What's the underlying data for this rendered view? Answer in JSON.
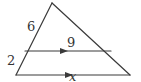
{
  "figure": {
    "type": "triangle-proportionality",
    "stroke_color": "#3a3a3a",
    "background": "#ffffff",
    "vertices": {
      "apex": [
        52,
        3
      ],
      "base_left": [
        16,
        75
      ],
      "base_right": [
        130,
        75
      ]
    },
    "parallel_segment": {
      "from": [
        25,
        51
      ],
      "to": [
        111,
        51
      ]
    },
    "arrow_positions": {
      "parallel_segment_x": 65,
      "base_x": 70
    }
  },
  "labels": {
    "upper_left_side": "6",
    "lower_left_side": "2",
    "parallel_segment": "9",
    "base": "x"
  }
}
